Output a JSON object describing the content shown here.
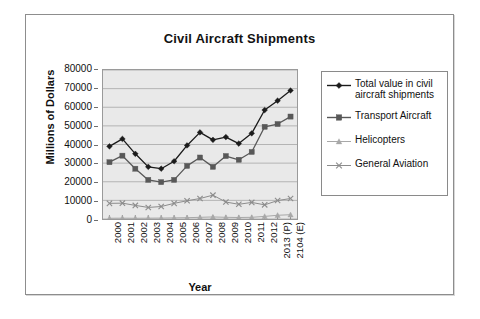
{
  "chart_data": {
    "type": "line",
    "title": "Civil Aircraft Shipments",
    "xlabel": "Year",
    "ylabel": "Millions of Dollars",
    "ylim": [
      0,
      80000
    ],
    "ytick_step": 10000,
    "yticks": [
      "80000",
      "70000",
      "60000",
      "50000",
      "40000",
      "30000",
      "20000",
      "10000",
      "0"
    ],
    "grid": "horizontal",
    "legend_position": "right",
    "categories": [
      "2000",
      "2001",
      "2002",
      "2003",
      "2004",
      "2005",
      "2006",
      "2007",
      "2008",
      "2009",
      "2010",
      "2011",
      "2012",
      "2013 (P)",
      "2104 (E)"
    ],
    "series": [
      {
        "name": "Total value in civil aircraft shipments",
        "legend_label": "Total value in civil\naircraft shipments",
        "marker": "diamond",
        "color": "#1b1b1b",
        "values": [
          39000,
          43000,
          35000,
          28000,
          27000,
          31000,
          39500,
          46500,
          42500,
          44000,
          40500,
          46000,
          58500,
          63500,
          69000
        ]
      },
      {
        "name": "Transport Aircraft",
        "legend_label": "Transport Aircraft",
        "marker": "square",
        "color": "#585858",
        "values": [
          30500,
          34000,
          27000,
          21000,
          19800,
          21000,
          28500,
          33000,
          28000,
          33800,
          31800,
          36000,
          49500,
          51000,
          55000
        ]
      },
      {
        "name": "Helicopters",
        "legend_label": "Helicopters",
        "marker": "triangle",
        "color": "#a8a8a8",
        "values": [
          400,
          450,
          400,
          450,
          500,
          600,
          700,
          900,
          1100,
          900,
          800,
          900,
          1400,
          2000,
          2300
        ]
      },
      {
        "name": "General Aviation",
        "legend_label": "General Aviation",
        "marker": "cross",
        "color": "#8c8c8c",
        "values": [
          8400,
          8500,
          7300,
          6200,
          6700,
          8400,
          9800,
          11000,
          12800,
          9100,
          7900,
          8900,
          7600,
          9900,
          11000
        ]
      }
    ]
  }
}
